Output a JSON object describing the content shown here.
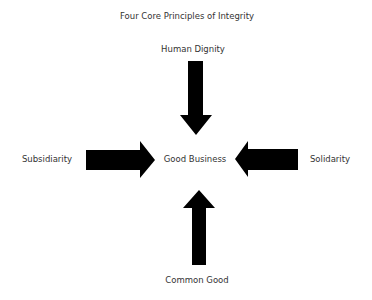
{
  "diagram": {
    "title": "Four Core Principles of Integrity",
    "center": "Good Business",
    "principles": {
      "top": "Human Dignity",
      "left": "Subsidiarity",
      "right": "Solidarity",
      "bottom": "Common Good"
    },
    "arrow_color": "#000000",
    "text_color": "#333333",
    "background": "#ffffff"
  }
}
